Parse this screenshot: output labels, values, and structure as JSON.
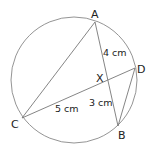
{
  "diagram": {
    "type": "circle-intersecting-chords",
    "points": {
      "A": {
        "label": "A",
        "x": 95,
        "y": 22
      },
      "B": {
        "label": "B",
        "x": 118,
        "y": 126
      },
      "C": {
        "label": "C",
        "x": 22,
        "y": 118
      },
      "D": {
        "label": "D",
        "x": 135,
        "y": 68
      },
      "X": {
        "label": "X",
        "x": 108,
        "y": 78
      }
    },
    "segments": [
      {
        "from": "A",
        "to": "C"
      },
      {
        "from": "A",
        "to": "B"
      },
      {
        "from": "C",
        "to": "D"
      },
      {
        "from": "D",
        "to": "B"
      }
    ],
    "measurements": {
      "AX": "4 cm",
      "XB": "3 cm",
      "CX": "5 cm"
    },
    "colors": {
      "line": "#777777",
      "text": "#222222",
      "background": "#ffffff"
    }
  }
}
